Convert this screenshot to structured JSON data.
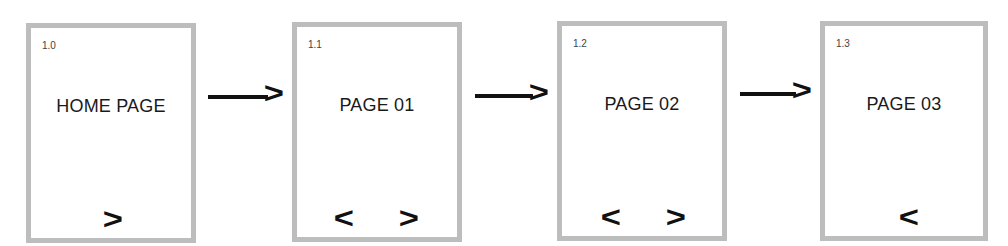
{
  "pages": [
    {
      "id": "1.0",
      "title": "HOME PAGE",
      "prev": "",
      "next": ">"
    },
    {
      "id": "1.1",
      "title": "PAGE 01",
      "prev": "<",
      "next": ">"
    },
    {
      "id": "1.2",
      "title": "PAGE 02",
      "prev": "<",
      "next": ">"
    },
    {
      "id": "1.3",
      "title": "PAGE 03",
      "prev": "<",
      "next": ""
    }
  ],
  "connectors": [
    {
      "from": "1.0",
      "to": "1.1",
      "head": ">"
    },
    {
      "from": "1.1",
      "to": "1.2",
      "head": ">"
    },
    {
      "from": "1.2",
      "to": "1.3",
      "head": ">"
    }
  ],
  "colors": {
    "border": "#bdbdbd",
    "ink": "#111111",
    "background": "#ffffff"
  }
}
